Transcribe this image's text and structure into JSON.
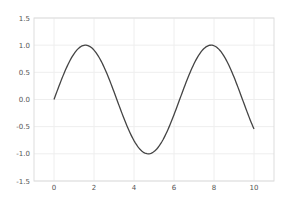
{
  "chart_data": {
    "type": "line",
    "title": "",
    "xlabel": "",
    "ylabel": "",
    "xlim": [
      -1,
      11
    ],
    "ylim": [
      -1.5,
      1.5
    ],
    "grid": true,
    "legend": null,
    "x_ticks": [
      "0",
      "2",
      "4",
      "6",
      "8",
      "10"
    ],
    "y_ticks": [
      "1.5",
      "1.0",
      "0.5",
      "0.0",
      "-0.5",
      "-1.0",
      "-1.5"
    ],
    "series": [
      {
        "name": "sin(x)",
        "function": "sin",
        "x_range": [
          0,
          10
        ],
        "color": "#444444",
        "x": [
          0,
          0.5,
          1,
          1.5,
          2,
          2.5,
          3,
          3.5,
          4,
          4.5,
          5,
          5.5,
          6,
          6.5,
          7,
          7.5,
          8,
          8.5,
          9,
          9.5,
          10
        ],
        "y": [
          0.0,
          0.48,
          0.84,
          1.0,
          0.91,
          0.6,
          0.14,
          -0.35,
          -0.76,
          -0.98,
          -0.96,
          -0.71,
          -0.28,
          0.22,
          0.66,
          0.94,
          0.99,
          0.8,
          0.41,
          -0.08,
          -0.54
        ]
      }
    ]
  },
  "colors": {
    "background": "#ffffff",
    "grid": "#eeeeee",
    "frame": "#dddddd",
    "line": "#444444",
    "tick_text": "#555555"
  }
}
